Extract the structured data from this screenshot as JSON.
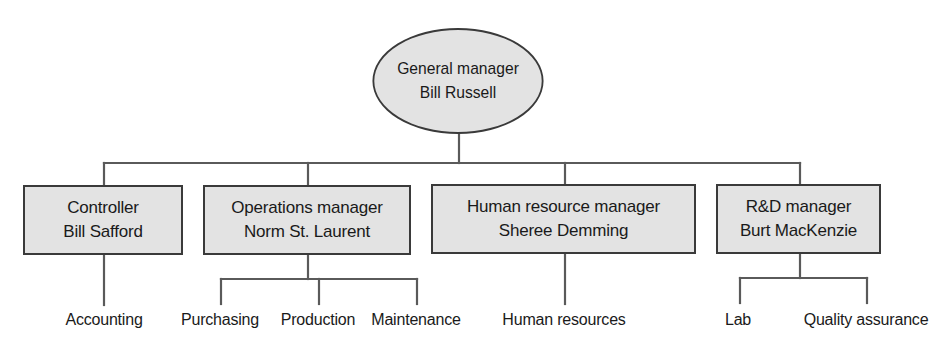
{
  "diagram": {
    "type": "organization-chart",
    "colors": {
      "node_fill": "#e3e3e3",
      "node_border": "#3a3a3a",
      "connector": "#5a5a5a",
      "text": "#1a1a1a"
    },
    "root": {
      "title": "General manager",
      "name": "Bill Russell",
      "shape": "ellipse"
    },
    "managers": [
      {
        "title": "Controller",
        "name": "Bill Safford",
        "departments": [
          "Accounting"
        ]
      },
      {
        "title": "Operations manager",
        "name": "Norm St. Laurent",
        "departments": [
          "Purchasing",
          "Production",
          "Maintenance"
        ]
      },
      {
        "title": "Human resource manager",
        "name": "Sheree Demming",
        "departments": [
          "Human resources"
        ]
      },
      {
        "title": "R&D manager",
        "name": "Burt MacKenzie",
        "departments": [
          "Lab",
          "Quality assurance"
        ]
      }
    ]
  }
}
